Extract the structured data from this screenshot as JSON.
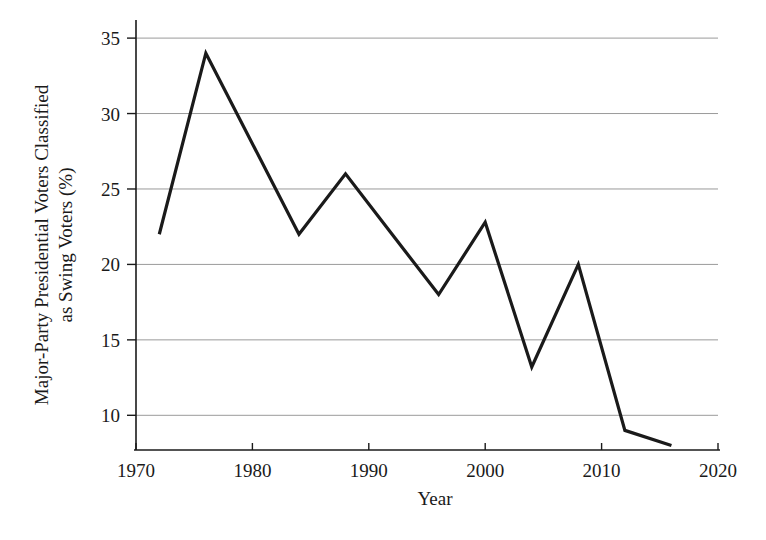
{
  "chart_data": {
    "type": "line",
    "title": "",
    "xlabel": "Year",
    "ylabel": "Major-Party Presidential Voters Classified as Swing Voters (%)",
    "ylabel_line1": "Major-Party Presidential Voters Classified",
    "ylabel_line2": "as Swing Voters (%)",
    "x": [
      1972,
      1976,
      1980,
      1984,
      1988,
      1992,
      1996,
      2000,
      2004,
      2008,
      2012,
      2016
    ],
    "values": [
      22,
      34,
      28,
      22,
      26,
      22,
      18,
      22.8,
      13.2,
      20,
      9,
      8
    ],
    "xlim": [
      1970,
      2020
    ],
    "ylim": [
      7.7,
      36.2
    ],
    "xticks": [
      1970,
      1980,
      1990,
      2000,
      2010,
      2020
    ],
    "xtick_labels": [
      "1970",
      "1980",
      "1990",
      "2000",
      "2010",
      "2020"
    ],
    "yticks": [
      10,
      15,
      20,
      25,
      30,
      35
    ],
    "ytick_labels": [
      "10",
      "15",
      "20",
      "25",
      "30",
      "35"
    ],
    "grid": "horizontal",
    "legend": "none",
    "line_color": "#1a1a1a",
    "grid_color": "#9a9a9a",
    "axis_color": "#1a1a1a"
  }
}
